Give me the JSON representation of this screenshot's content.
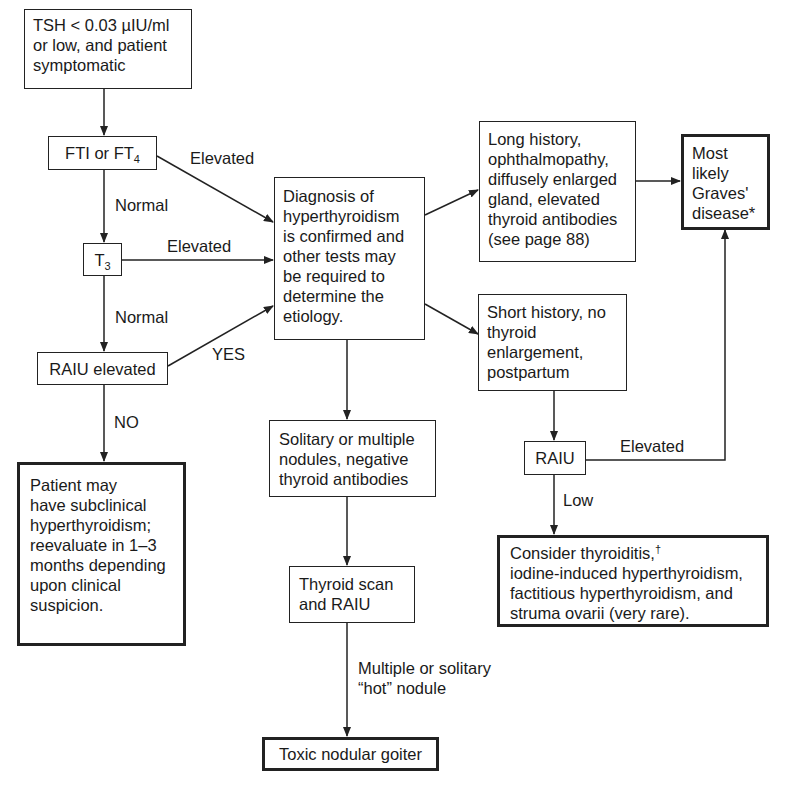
{
  "flowchart": {
    "nodes": {
      "tsh": {
        "lines": [
          "TSH < 0.03 µIU/ml",
          "or low, and patient",
          "symptomatic"
        ]
      },
      "fti": {
        "text": "FTI or FT",
        "sub": "4"
      },
      "t3": {
        "text": "T",
        "sub": "3"
      },
      "raiu_elevated": {
        "text": "RAIU elevated"
      },
      "subclinical": {
        "lines": [
          "Patient may",
          "have subclinical",
          "hyperthyroidism;",
          "reevaluate in 1–3",
          "months depending",
          "upon clinical",
          "suspicion."
        ]
      },
      "diagnosis": {
        "lines": [
          "Diagnosis of",
          "hyperthyroidism",
          "is confirmed and",
          "other tests may",
          "be required to",
          "determine the",
          "etiology."
        ]
      },
      "long_history": {
        "lines": [
          "Long history,",
          "ophthalmopathy,",
          "diffusely enlarged",
          "gland, elevated",
          "thyroid antibodies",
          "(see page 88)"
        ]
      },
      "graves": {
        "lines": [
          "Most",
          "likely",
          "Graves'",
          "disease*"
        ]
      },
      "short_history": {
        "lines": [
          "Short history, no",
          "thyroid",
          "enlargement,",
          "postpartum"
        ]
      },
      "raiu": {
        "text": "RAIU"
      },
      "consider": {
        "first": "Consider thyroiditis,",
        "dagger": "†",
        "lines": [
          "iodine-induced hyperthyroidism,",
          "factitious hyperthyroidism, and",
          "struma ovarii (very rare)."
        ]
      },
      "nodules": {
        "lines": [
          "Solitary or multiple",
          "nodules, negative",
          "thyroid antibodies"
        ]
      },
      "scan": {
        "lines": [
          "Thyroid scan",
          "and RAIU"
        ]
      },
      "toxic": {
        "text": "Toxic nodular goiter"
      }
    },
    "edge_labels": {
      "fti_elevated": "Elevated",
      "fti_normal": "Normal",
      "t3_elevated": "Elevated",
      "t3_normal": "Normal",
      "raiu_yes": "YES",
      "raiu_no": "NO",
      "raiu_right_elevated": "Elevated",
      "raiu_right_low": "Low",
      "hot_nodule_1": "Multiple or solitary",
      "hot_nodule_2": "“hot” nodule"
    }
  }
}
